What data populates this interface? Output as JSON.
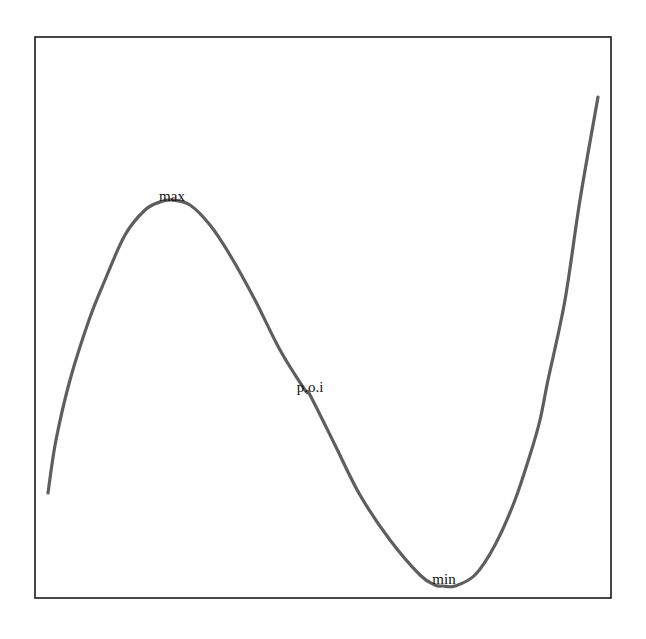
{
  "chart_data": {
    "type": "line",
    "title": "",
    "xlabel": "",
    "ylabel": "",
    "grid": false,
    "legend": null,
    "coordinate_system": "screen pixels (no axis ticks shown)",
    "plot_frame": {
      "x0": 35,
      "y0": 37,
      "x1": 611,
      "y1": 598
    },
    "series": [
      {
        "name": "cubic",
        "color": "#5e5e5e",
        "points": [
          [
            48,
            493
          ],
          [
            56,
            440
          ],
          [
            70,
            380
          ],
          [
            89,
            320
          ],
          [
            105,
            280
          ],
          [
            125,
            235
          ],
          [
            145,
            210
          ],
          [
            160,
            202
          ],
          [
            172,
            200
          ],
          [
            190,
            205
          ],
          [
            210,
            225
          ],
          [
            230,
            255
          ],
          [
            255,
            300
          ],
          [
            280,
            350
          ],
          [
            305,
            390
          ],
          [
            310,
            395
          ],
          [
            335,
            445
          ],
          [
            360,
            495
          ],
          [
            390,
            540
          ],
          [
            420,
            575
          ],
          [
            435,
            585
          ],
          [
            443,
            586
          ],
          [
            455,
            586
          ],
          [
            475,
            575
          ],
          [
            495,
            545
          ],
          [
            515,
            500
          ],
          [
            530,
            455
          ],
          [
            540,
            420
          ],
          [
            548,
            380
          ],
          [
            565,
            300
          ],
          [
            580,
            200
          ],
          [
            598,
            97
          ]
        ]
      }
    ],
    "annotations": [
      {
        "label": "max",
        "x": 172,
        "y": 201
      },
      {
        "label": "p.o.i",
        "x": 310,
        "y": 392
      },
      {
        "label": "min",
        "x": 444,
        "y": 584
      }
    ]
  },
  "labels": {
    "max": "max",
    "poi": "p.o.i",
    "min": "min"
  },
  "colors": {
    "curve": "#5e5e5e",
    "frame": "#1a1a1a",
    "text": "#111111",
    "background": "#ffffff"
  }
}
